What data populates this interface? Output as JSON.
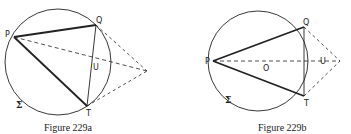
{
  "figures": [
    {
      "caption": "Figure 229a",
      "circle_label": "Σ",
      "points": {
        "P": "P",
        "Q": "Q",
        "T": "T",
        "U": "U"
      }
    },
    {
      "caption": "Figure 229b",
      "circle_label": "Σ",
      "points": {
        "P": "P",
        "Q": "Q",
        "T": "T",
        "U": "U",
        "O": "O"
      }
    }
  ],
  "colors": {
    "stroke": "#222222",
    "background": "#ffffff"
  }
}
